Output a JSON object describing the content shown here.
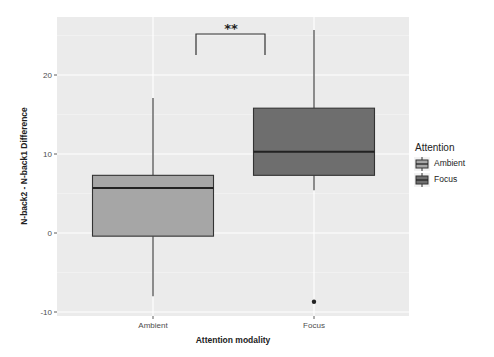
{
  "chart_data": {
    "type": "boxplot",
    "title": "",
    "xlabel": "Attention modality",
    "ylabel": "N-back2 - N-back1 Difference",
    "ylim": [
      -11,
      27
    ],
    "yticks": [
      -10,
      0,
      10,
      20
    ],
    "grid": true,
    "categories": [
      "Ambient",
      "Focus"
    ],
    "series": [
      {
        "name": "Ambient",
        "category": "Ambient",
        "whisker_low": -8.0,
        "q1": -0.4,
        "median": 5.7,
        "q3": 7.3,
        "whisker_high": 17.1,
        "outliers": [],
        "fill": "#a6a6a6"
      },
      {
        "name": "Focus",
        "category": "Focus",
        "whisker_low": 5.4,
        "q1": 7.3,
        "median": 10.3,
        "q3": 15.8,
        "whisker_high": 25.7,
        "outliers": [
          -8.7
        ],
        "fill": "#6e6e6e"
      }
    ],
    "annotations": [
      {
        "type": "significance-bracket",
        "between": [
          "Ambient",
          "Focus"
        ],
        "label": "**"
      }
    ],
    "legend": {
      "title": "Attention",
      "position": "right",
      "entries": [
        "Ambient",
        "Focus"
      ]
    }
  },
  "labels": {
    "xlabel": "Attention modality",
    "ylabel": "N-back2 - N-back1 Difference",
    "xticks": [
      "Ambient",
      "Focus"
    ],
    "yticks": [
      "-10",
      "0",
      "10",
      "20"
    ],
    "significance": "**",
    "legend_title": "Attention",
    "legend_entries": [
      "Ambient",
      "Focus"
    ]
  },
  "colors": {
    "panel_bg": "#ebebeb",
    "grid": "#ffffff",
    "ambient_fill": "#a6a6a6",
    "focus_fill": "#6e6e6e",
    "line": "#333333"
  }
}
